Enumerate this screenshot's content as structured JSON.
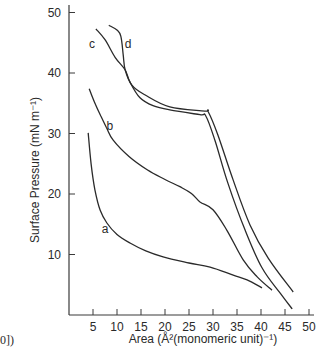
{
  "chart_data": {
    "type": "line",
    "title": "",
    "xlabel": "Area (Å²(monomeric unit)⁻¹)",
    "ylabel": "Surface Pressure (mN m⁻¹)",
    "xlim": [
      0,
      52
    ],
    "ylim": [
      0,
      52
    ],
    "x_ticks": [
      5,
      10,
      15,
      20,
      25,
      30,
      35,
      40,
      45,
      50
    ],
    "y_ticks": [
      10,
      20,
      30,
      40,
      50
    ],
    "grid": false,
    "legend": "inline curve labels",
    "series": [
      {
        "name": "a",
        "label_pos": [
          7.5,
          13.5
        ],
        "points": [
          [
            4.0,
            30.1
          ],
          [
            4.6,
            25.0
          ],
          [
            5.4,
            20.7
          ],
          [
            6.5,
            17.3
          ],
          [
            7.9,
            15.2
          ],
          [
            10.0,
            13.3
          ],
          [
            12.7,
            11.9
          ],
          [
            16.0,
            10.6
          ],
          [
            19.6,
            9.6
          ],
          [
            25.0,
            8.6
          ],
          [
            29.4,
            7.9
          ],
          [
            34.2,
            6.6
          ],
          [
            37.1,
            5.8
          ],
          [
            40.2,
            4.5
          ]
        ]
      },
      {
        "name": "b",
        "label_pos": [
          8.5,
          30.5
        ],
        "points": [
          [
            4.2,
            37.4
          ],
          [
            5.3,
            35.2
          ],
          [
            6.5,
            33.1
          ],
          [
            7.8,
            31.0
          ],
          [
            9.2,
            28.9
          ],
          [
            12.5,
            26.2
          ],
          [
            16.3,
            24.0
          ],
          [
            20.0,
            22.4
          ],
          [
            23.1,
            21.2
          ],
          [
            25.5,
            20.1
          ],
          [
            27.3,
            18.7
          ],
          [
            30.0,
            17.4
          ],
          [
            32.9,
            14.0
          ],
          [
            36.3,
            9.1
          ],
          [
            39.2,
            6.3
          ],
          [
            42.3,
            4.1
          ]
        ]
      },
      {
        "name": "c",
        "label_pos": [
          4.8,
          44.2
        ],
        "points": [
          [
            5.6,
            47.3
          ],
          [
            7.5,
            45.5
          ],
          [
            9.6,
            42.6
          ],
          [
            11.7,
            40.5
          ],
          [
            12.7,
            38.5
          ],
          [
            14.8,
            35.9
          ],
          [
            17.5,
            34.6
          ],
          [
            21.0,
            33.9
          ],
          [
            27.3,
            33.1
          ],
          [
            28.5,
            32.9
          ],
          [
            30.4,
            28.9
          ],
          [
            33.1,
            21.8
          ],
          [
            36.7,
            14.0
          ],
          [
            40.2,
            7.8
          ],
          [
            44.0,
            3.6
          ],
          [
            46.5,
            1.0
          ]
        ]
      },
      {
        "name": "d",
        "label_pos": [
          12.3,
          44.2
        ],
        "points": [
          [
            8.3,
            47.9
          ],
          [
            10.0,
            47.1
          ],
          [
            10.8,
            46.1
          ],
          [
            11.3,
            43.0
          ],
          [
            11.7,
            40.5
          ],
          [
            13.1,
            38.0
          ],
          [
            15.8,
            36.4
          ],
          [
            21.0,
            34.4
          ],
          [
            28.3,
            33.7
          ],
          [
            29.0,
            33.6
          ],
          [
            31.0,
            29.8
          ],
          [
            34.2,
            22.3
          ],
          [
            37.7,
            14.9
          ],
          [
            41.5,
            9.4
          ],
          [
            46.7,
            3.8
          ]
        ]
      }
    ]
  },
  "fragment_text": "0])",
  "colors": {
    "line": "#2a2a2a",
    "axis": "#3a3a3a"
  }
}
